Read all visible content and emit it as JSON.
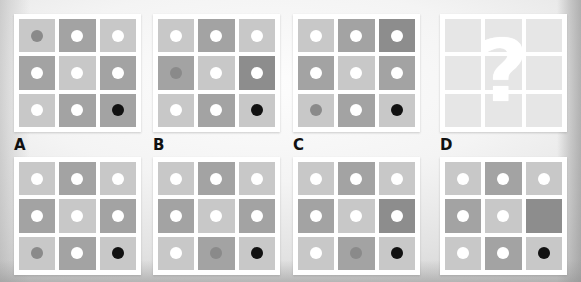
{
  "puzzle": {
    "kind": "matrix-reasoning-puzzle",
    "palette": {
      "cell_light": "#c8c8c8",
      "cell_light_alt": "#cfcfcf",
      "cell_medium": "#a3a3a3",
      "cell_dark": "#8d8d8d",
      "cell_blank_light": "#e6e6e6",
      "dot_white": "#ffffff",
      "dot_gray": "#8a8a8a",
      "dot_black": "#111111",
      "grid_frame": "#ffffff",
      "background": "#e9e9e9",
      "label_color": "#111111"
    },
    "question_mark": "?",
    "labels": [
      {
        "id": "label-a",
        "text": "A",
        "left": 14
      },
      {
        "id": "label-b",
        "text": "B",
        "left": 153
      },
      {
        "id": "label-c",
        "text": "C",
        "left": 293
      },
      {
        "id": "label-d",
        "text": "D",
        "left": 440
      }
    ],
    "reference_grids": [
      {
        "name": "reference-grid-1",
        "left": 14,
        "cells": [
          {
            "shade": "cell_light",
            "dot": "dot_gray"
          },
          {
            "shade": "cell_medium",
            "dot": "dot_white"
          },
          {
            "shade": "cell_light",
            "dot": "dot_white"
          },
          {
            "shade": "cell_medium",
            "dot": "dot_white"
          },
          {
            "shade": "cell_light",
            "dot": "dot_white"
          },
          {
            "shade": "cell_medium",
            "dot": "dot_white"
          },
          {
            "shade": "cell_light",
            "dot": "dot_white"
          },
          {
            "shade": "cell_medium",
            "dot": "dot_white"
          },
          {
            "shade": "cell_medium",
            "dot": "dot_black"
          }
        ]
      },
      {
        "name": "reference-grid-2",
        "left": 153,
        "cells": [
          {
            "shade": "cell_light",
            "dot": "dot_white"
          },
          {
            "shade": "cell_medium",
            "dot": "dot_white"
          },
          {
            "shade": "cell_light",
            "dot": "dot_white"
          },
          {
            "shade": "cell_medium",
            "dot": "dot_gray"
          },
          {
            "shade": "cell_light",
            "dot": "dot_white"
          },
          {
            "shade": "cell_dark",
            "dot": "dot_white"
          },
          {
            "shade": "cell_light",
            "dot": "dot_white"
          },
          {
            "shade": "cell_medium",
            "dot": "dot_white"
          },
          {
            "shade": "cell_light",
            "dot": "dot_black"
          }
        ]
      },
      {
        "name": "reference-grid-3",
        "left": 293,
        "cells": [
          {
            "shade": "cell_light",
            "dot": "dot_white"
          },
          {
            "shade": "cell_medium",
            "dot": "dot_white"
          },
          {
            "shade": "cell_dark",
            "dot": "dot_white"
          },
          {
            "shade": "cell_medium",
            "dot": "dot_white"
          },
          {
            "shade": "cell_light",
            "dot": "dot_white"
          },
          {
            "shade": "cell_medium",
            "dot": "dot_white"
          },
          {
            "shade": "cell_light",
            "dot": "dot_gray"
          },
          {
            "shade": "cell_medium",
            "dot": "dot_white"
          },
          {
            "shade": "cell_light",
            "dot": "dot_black"
          }
        ]
      },
      {
        "name": "reference-grid-4-unknown",
        "left": 440,
        "is_question": true,
        "cells": [
          {
            "shade": "cell_blank_light",
            "dot": null
          },
          {
            "shade": "cell_blank_light",
            "dot": null
          },
          {
            "shade": "cell_blank_light",
            "dot": null
          },
          {
            "shade": "cell_blank_light",
            "dot": null
          },
          {
            "shade": "cell_blank_light",
            "dot": null
          },
          {
            "shade": "cell_blank_light",
            "dot": null
          },
          {
            "shade": "cell_blank_light",
            "dot": null
          },
          {
            "shade": "cell_blank_light",
            "dot": null
          },
          {
            "shade": "cell_blank_light",
            "dot": null
          }
        ]
      }
    ],
    "option_grids": [
      {
        "name": "option-grid-a",
        "left": 14,
        "cells": [
          {
            "shade": "cell_light",
            "dot": "dot_white"
          },
          {
            "shade": "cell_medium",
            "dot": "dot_white"
          },
          {
            "shade": "cell_light",
            "dot": "dot_white"
          },
          {
            "shade": "cell_medium",
            "dot": "dot_white"
          },
          {
            "shade": "cell_light",
            "dot": "dot_white"
          },
          {
            "shade": "cell_medium",
            "dot": "dot_white"
          },
          {
            "shade": "cell_light",
            "dot": "dot_gray"
          },
          {
            "shade": "cell_medium",
            "dot": "dot_white"
          },
          {
            "shade": "cell_light",
            "dot": "dot_black"
          }
        ]
      },
      {
        "name": "option-grid-b",
        "left": 153,
        "cells": [
          {
            "shade": "cell_light",
            "dot": "dot_white"
          },
          {
            "shade": "cell_medium",
            "dot": "dot_white"
          },
          {
            "shade": "cell_light",
            "dot": "dot_white"
          },
          {
            "shade": "cell_medium",
            "dot": "dot_white"
          },
          {
            "shade": "cell_light",
            "dot": "dot_white"
          },
          {
            "shade": "cell_medium",
            "dot": "dot_white"
          },
          {
            "shade": "cell_light",
            "dot": "dot_white"
          },
          {
            "shade": "cell_medium",
            "dot": "dot_gray"
          },
          {
            "shade": "cell_light",
            "dot": "dot_black"
          }
        ]
      },
      {
        "name": "option-grid-c",
        "left": 293,
        "cells": [
          {
            "shade": "cell_light",
            "dot": "dot_white"
          },
          {
            "shade": "cell_medium",
            "dot": "dot_white"
          },
          {
            "shade": "cell_light",
            "dot": "dot_white"
          },
          {
            "shade": "cell_medium",
            "dot": "dot_white"
          },
          {
            "shade": "cell_light",
            "dot": "dot_white"
          },
          {
            "shade": "cell_dark",
            "dot": "dot_white"
          },
          {
            "shade": "cell_light",
            "dot": "dot_white"
          },
          {
            "shade": "cell_medium",
            "dot": "dot_gray"
          },
          {
            "shade": "cell_light",
            "dot": "dot_black"
          }
        ]
      },
      {
        "name": "option-grid-d",
        "left": 440,
        "cells": [
          {
            "shade": "cell_light",
            "dot": "dot_white"
          },
          {
            "shade": "cell_medium",
            "dot": "dot_white"
          },
          {
            "shade": "cell_light",
            "dot": "dot_white"
          },
          {
            "shade": "cell_medium",
            "dot": "dot_white"
          },
          {
            "shade": "cell_light",
            "dot": "dot_white"
          },
          {
            "shade": "cell_dark",
            "dot": null
          },
          {
            "shade": "cell_light",
            "dot": "dot_white"
          },
          {
            "shade": "cell_medium",
            "dot": "dot_white"
          },
          {
            "shade": "cell_light",
            "dot": "dot_black"
          }
        ]
      }
    ]
  }
}
